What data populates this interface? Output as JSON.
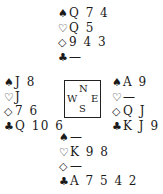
{
  "suits": {
    "spades": "♠",
    "hearts": "♡",
    "diamonds": "◇",
    "clubs": "♣"
  },
  "hands": {
    "north": {
      "spades": "Q 7 4",
      "hearts": "Q 5",
      "diamonds": "9 4 3",
      "clubs": "—"
    },
    "west": {
      "spades": "J 8",
      "hearts": "J",
      "diamonds": "7 6",
      "clubs": "Q 10 6"
    },
    "east": {
      "spades": "A 9",
      "hearts": "—",
      "diamonds": "Q J",
      "clubs": "K J 9 8"
    },
    "south": {
      "spades": "—",
      "hearts": "K 9 8",
      "diamonds": "—",
      "clubs": "A 7 5 4 2"
    }
  },
  "compass": {
    "n": "N",
    "s": "S",
    "w": "W",
    "e": "E"
  }
}
